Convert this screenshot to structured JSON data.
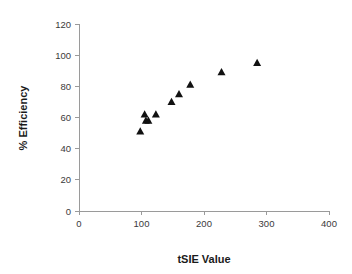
{
  "chart_data": {
    "type": "scatter",
    "title": "",
    "xlabel": "tSIE Value",
    "ylabel": "% Efficiency",
    "xlim": [
      0,
      400
    ],
    "ylim": [
      0,
      120
    ],
    "xticks": [
      0,
      100,
      200,
      300,
      400
    ],
    "yticks": [
      0,
      20,
      40,
      60,
      80,
      100,
      120
    ],
    "xtick_labels": [
      "0",
      "100",
      "200",
      "300",
      "400"
    ],
    "ytick_labels": [
      "0",
      "20",
      "40",
      "60",
      "80",
      "100",
      "120"
    ],
    "grid": false,
    "legend": false,
    "marker": "triangle-up",
    "marker_color": "#111111",
    "series": [
      {
        "name": "Efficiency vs tSIE",
        "points": [
          {
            "x": 98,
            "y": 51
          },
          {
            "x": 105,
            "y": 62
          },
          {
            "x": 107,
            "y": 58
          },
          {
            "x": 111,
            "y": 58
          },
          {
            "x": 123,
            "y": 62
          },
          {
            "x": 148,
            "y": 70
          },
          {
            "x": 160,
            "y": 75
          },
          {
            "x": 178,
            "y": 81
          },
          {
            "x": 228,
            "y": 89
          },
          {
            "x": 285,
            "y": 95
          }
        ]
      }
    ]
  },
  "axes": {
    "x_title": "tSIE Value",
    "y_title": "% Efficiency"
  }
}
